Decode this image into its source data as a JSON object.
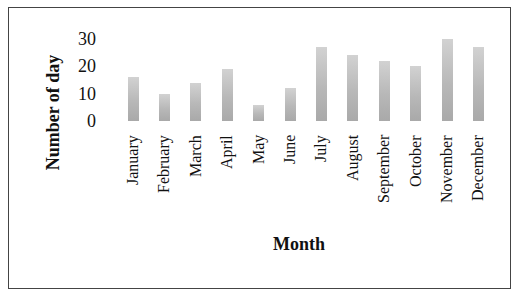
{
  "chart_data": {
    "type": "bar",
    "title": "",
    "xlabel": "Month",
    "ylabel": "Number of day",
    "ylim": [
      0,
      30
    ],
    "yticks": [
      "0",
      "10",
      "20",
      "30"
    ],
    "grid": false,
    "legend": null,
    "categories": [
      "January",
      "February",
      "March",
      "April",
      "May",
      "June",
      "July",
      "August",
      "September",
      "October",
      "November",
      "December"
    ],
    "values": [
      16,
      10,
      14,
      19,
      6,
      12,
      27,
      24,
      22,
      20,
      30,
      27
    ]
  },
  "colors": {
    "bar_top": "#d2d2d2",
    "bar_bottom": "#a9a9a9",
    "border": "#444444"
  }
}
